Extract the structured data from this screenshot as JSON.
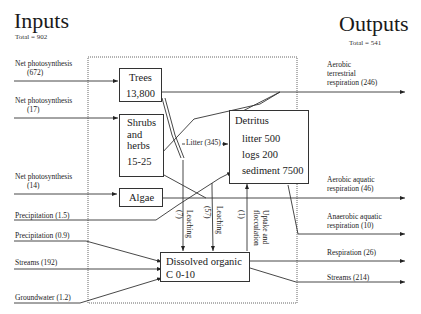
{
  "inputs": {
    "title": "Inputs",
    "total": "Total = 902",
    "flows": [
      {
        "label": "Net photosynthesis",
        "value": "(672)"
      },
      {
        "label": "Net photosynthesis",
        "value": "(17)"
      },
      {
        "label": "Net photosynthesis",
        "value": "(14)"
      },
      {
        "label": "Precipitation  (1.5)"
      },
      {
        "label": "Precipitation  (0.9)"
      },
      {
        "label": "Streams (192)"
      },
      {
        "label": "Groundwater  (1.2)"
      }
    ]
  },
  "outputs": {
    "title": "Outputs",
    "total": "Total = 541",
    "flows": [
      {
        "lines": [
          "Aerobic",
          "terrestrial",
          "respiration  (246)"
        ]
      },
      {
        "lines": [
          "Aerobic  aquatic",
          "respiration  (46)"
        ]
      },
      {
        "lines": [
          "Anaerobic  aquatic",
          "respiration  (10)"
        ]
      },
      {
        "lines": [
          "Respiration  (26)"
        ]
      },
      {
        "lines": [
          "Streams (214)"
        ]
      }
    ]
  },
  "pools": {
    "trees": {
      "name": "Trees",
      "value": "13,800"
    },
    "shrubs": {
      "lines": [
        "Shrubs",
        "and",
        "herbs",
        "15-25"
      ]
    },
    "algae": {
      "name": "Algae"
    },
    "detritus": {
      "name": "Detritus",
      "lines": [
        "litter 500",
        "logs  200",
        "sediment 7500"
      ]
    },
    "doc": {
      "lines": [
        "Dissolved organic",
        "C 0-10"
      ]
    }
  },
  "internal_flows": {
    "litter": "Litter (345)",
    "leaching1": {
      "label": "Leaching",
      "value": "(7)"
    },
    "leaching2": {
      "label": "Leaching",
      "value": "(57)"
    },
    "uptake": {
      "label": "Uptake and",
      "label2": "flocculation",
      "value": "(1)"
    }
  },
  "colors": {
    "line": "#333333",
    "boundary": "#555555"
  }
}
